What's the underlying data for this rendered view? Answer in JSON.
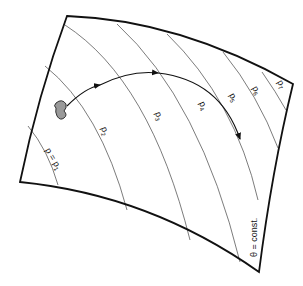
{
  "diagram": {
    "surface_label": "θ = const.",
    "isobar_labels": [
      {
        "base": "p = p",
        "sub": "1"
      },
      {
        "base": "p",
        "sub": "2"
      },
      {
        "base": "p",
        "sub": "3"
      },
      {
        "base": "p",
        "sub": "4"
      },
      {
        "base": "p",
        "sub": "5"
      },
      {
        "base": "p",
        "sub": "6"
      },
      {
        "base": "p",
        "sub": "7"
      }
    ],
    "parcel": "fluid-parcel-blob",
    "trajectory": "curved-arrow-path",
    "colors": {
      "outline": "#111111",
      "isobar": "#444444",
      "parcel_fill": "#999999"
    }
  }
}
